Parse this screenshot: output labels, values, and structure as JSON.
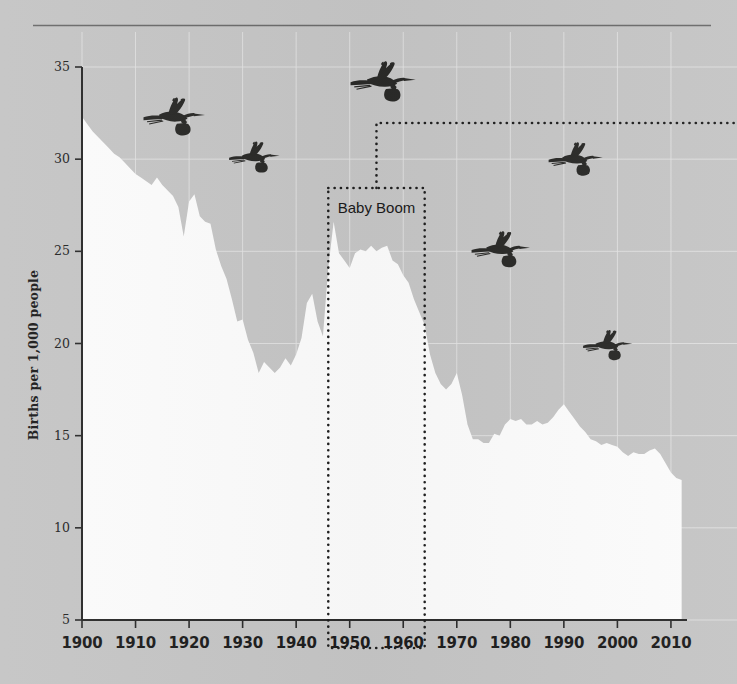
{
  "figure": {
    "background_color": "#c5c5c5",
    "area_color": "#fbfbfb",
    "ink_color": "#1f1f1f",
    "grid_color": "#e3e3e3",
    "top_rule": true
  },
  "annotations": {
    "baby_boom": {
      "label": "Baby Boom",
      "start_year": 1946,
      "end_year": 1964,
      "leader": "dotted-elbow-to-right-edge"
    }
  },
  "icons": [
    {
      "name": "stork-icon",
      "year": 1917,
      "value": 32.3,
      "scale": 1.0
    },
    {
      "name": "stork-icon",
      "year": 1932,
      "value": 30.1,
      "scale": 0.82
    },
    {
      "name": "stork-icon",
      "year": 1956,
      "value": 34.2,
      "scale": 1.06
    },
    {
      "name": "stork-icon",
      "year": 1978,
      "value": 25.1,
      "scale": 0.95
    },
    {
      "name": "stork-icon",
      "year": 1992,
      "value": 30.0,
      "scale": 0.88
    },
    {
      "name": "stork-icon",
      "year": 1998,
      "value": 19.9,
      "scale": 0.8
    }
  ],
  "chart_data": {
    "type": "area",
    "title": "",
    "subtitle": "",
    "xlabel": "",
    "ylabel": "Births per 1,000 people",
    "xlim": [
      1900,
      2013
    ],
    "ylim": [
      5,
      35
    ],
    "xticks": [
      1900,
      1910,
      1920,
      1930,
      1940,
      1950,
      1960,
      1970,
      1980,
      1990,
      2000,
      2010
    ],
    "xticklabels": [
      "1900",
      "1910",
      "1920",
      "1930",
      "1940",
      "1950",
      "1960",
      "1970",
      "1980",
      "1990",
      "2000",
      "2010"
    ],
    "yticks": [
      5,
      10,
      15,
      20,
      25,
      30,
      35
    ],
    "yticklabels": [
      "5",
      "10",
      "15",
      "20",
      "25",
      "30",
      "35"
    ],
    "grid": true,
    "legend": null,
    "series": [
      {
        "name": "Births per 1,000 people",
        "fill": "#fbfbfb",
        "x": [
          1900,
          1901,
          1902,
          1903,
          1904,
          1905,
          1906,
          1907,
          1908,
          1909,
          1910,
          1911,
          1912,
          1913,
          1914,
          1915,
          1916,
          1917,
          1918,
          1919,
          1920,
          1921,
          1922,
          1923,
          1924,
          1925,
          1926,
          1927,
          1928,
          1929,
          1930,
          1931,
          1932,
          1933,
          1934,
          1935,
          1936,
          1937,
          1938,
          1939,
          1940,
          1941,
          1942,
          1943,
          1944,
          1945,
          1946,
          1947,
          1948,
          1949,
          1950,
          1951,
          1952,
          1953,
          1954,
          1955,
          1956,
          1957,
          1958,
          1959,
          1960,
          1961,
          1962,
          1963,
          1964,
          1965,
          1966,
          1967,
          1968,
          1969,
          1970,
          1971,
          1972,
          1973,
          1974,
          1975,
          1976,
          1977,
          1978,
          1979,
          1980,
          1981,
          1982,
          1983,
          1984,
          1985,
          1986,
          1987,
          1988,
          1989,
          1990,
          1991,
          1992,
          1993,
          1994,
          1995,
          1996,
          1997,
          1998,
          1999,
          2000,
          2001,
          2002,
          2003,
          2004,
          2005,
          2006,
          2007,
          2008,
          2009,
          2010,
          2011,
          2012
        ],
        "y": [
          32.3,
          31.9,
          31.5,
          31.2,
          30.9,
          30.6,
          30.3,
          30.1,
          29.8,
          29.5,
          29.2,
          29.0,
          28.8,
          28.6,
          29.0,
          28.6,
          28.3,
          28.0,
          27.4,
          25.8,
          27.7,
          28.1,
          26.9,
          26.6,
          26.5,
          25.1,
          24.2,
          23.5,
          22.4,
          21.2,
          21.3,
          20.2,
          19.5,
          18.4,
          19.0,
          18.7,
          18.4,
          18.7,
          19.2,
          18.8,
          19.4,
          20.3,
          22.2,
          22.7,
          21.2,
          20.4,
          24.1,
          26.6,
          24.9,
          24.5,
          24.1,
          24.9,
          25.1,
          25.0,
          25.3,
          25.0,
          25.2,
          25.3,
          24.5,
          24.3,
          23.7,
          23.3,
          22.4,
          21.7,
          21.0,
          19.4,
          18.4,
          17.8,
          17.5,
          17.8,
          18.4,
          17.2,
          15.6,
          14.8,
          14.8,
          14.6,
          14.6,
          15.1,
          15.0,
          15.6,
          15.9,
          15.8,
          15.9,
          15.6,
          15.6,
          15.8,
          15.6,
          15.7,
          16.0,
          16.4,
          16.7,
          16.3,
          15.9,
          15.5,
          15.2,
          14.8,
          14.7,
          14.5,
          14.6,
          14.5,
          14.4,
          14.1,
          13.9,
          14.1,
          14.0,
          14.0,
          14.2,
          14.3,
          14.0,
          13.5,
          13.0,
          12.7,
          12.6
        ]
      }
    ]
  }
}
